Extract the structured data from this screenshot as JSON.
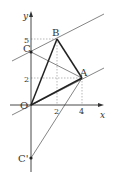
{
  "diagram": {
    "axes": {
      "x_label": "x",
      "y_label": "y",
      "origin_label": "O"
    },
    "ticks": {
      "x": [
        "2",
        "4"
      ],
      "y": [
        "5",
        "2"
      ]
    },
    "points": [
      {
        "name": "O",
        "x": 0,
        "y": 0
      },
      {
        "name": "A",
        "x": 4,
        "y": 2
      },
      {
        "name": "B",
        "x": 2,
        "y": 5
      },
      {
        "name": "C",
        "x": 0,
        "y": 4
      },
      {
        "name": "C'",
        "x": 0,
        "y": -4
      }
    ],
    "labels": {
      "A": "A",
      "B": "B",
      "C": "C",
      "C_prime": "C'"
    },
    "colors": {
      "line": "#333333",
      "dashed": "#777777"
    }
  }
}
